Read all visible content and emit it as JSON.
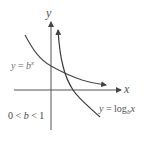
{
  "figure": {
    "axes": {
      "x_label": "x",
      "y_label": "y"
    },
    "curves": [
      {
        "name": "exponential",
        "label_prefix": "y = ",
        "label_base": "b",
        "label_sup": "x",
        "color": "#555555"
      },
      {
        "name": "logarithm",
        "label_prefix": "y = log",
        "label_sub": "b",
        "label_suffix": "x",
        "color": "#444444"
      }
    ],
    "condition": {
      "left": "0 < ",
      "var": "b",
      "right": " < 1"
    },
    "colors": {
      "axis": "#555555",
      "curve": "#4a4a4a"
    }
  }
}
